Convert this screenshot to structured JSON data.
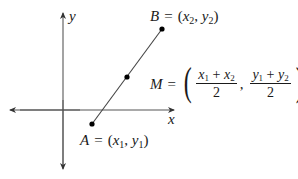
{
  "diagram": {
    "axes": {
      "x_label": "x",
      "y_label": "y"
    },
    "points": {
      "A": {
        "name": "A",
        "x_sym": "x",
        "x_sub": "1",
        "y_sym": "y",
        "y_sub": "1"
      },
      "B": {
        "name": "B",
        "x_sym": "x",
        "x_sub": "2",
        "y_sym": "y",
        "y_sub": "2"
      },
      "M": {
        "name": "M"
      }
    },
    "formula": {
      "lhs": "M",
      "equals": "=",
      "open_paren": "(",
      "close_paren": ")",
      "separator": ",",
      "frac1": {
        "a_sym": "x",
        "a_sub": "1",
        "op": "+",
        "b_sym": "x",
        "b_sub": "2",
        "denominator": "2"
      },
      "frac2": {
        "a_sym": "y",
        "a_sub": "1",
        "op": "+",
        "b_sym": "y",
        "b_sub": "2",
        "denominator": "2"
      }
    },
    "symbols": {
      "equals": "=",
      "open_paren": "(",
      "close_paren": ")",
      "comma": ","
    },
    "colors": {
      "axis": "#555555",
      "segment": "#333333",
      "point": "#000000",
      "text": "#1a1a1a"
    }
  }
}
